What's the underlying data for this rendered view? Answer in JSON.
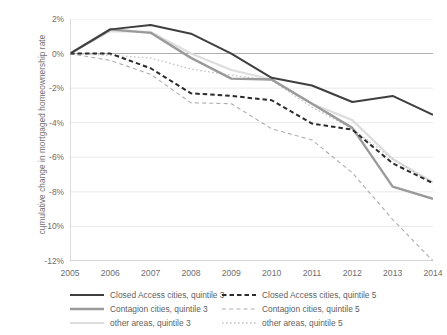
{
  "chart_data": {
    "type": "line",
    "title": "",
    "subtitle": "",
    "xlabel": "",
    "ylabel": "cumulative change in mortgaged homeownership rate",
    "x": [
      2005,
      2006,
      2007,
      2008,
      2009,
      2010,
      2011,
      2012,
      2013,
      2014
    ],
    "xticklabels": [
      "2005",
      "2006",
      "2007",
      "2008",
      "2009",
      "2010",
      "2011",
      "2012",
      "2013",
      "2014"
    ],
    "yticklabels": [
      "2%",
      "0%",
      "-2%",
      "-4%",
      "-6%",
      "-8%",
      "-10%",
      "-12%"
    ],
    "yticks": [
      2,
      0,
      -2,
      -4,
      -6,
      -8,
      -10,
      -12
    ],
    "ylim": [
      -12,
      2
    ],
    "xlim": [
      2005,
      2014
    ],
    "grid": "horizontal",
    "legend_position": "bottom",
    "units": "percent",
    "series": [
      {
        "name": "Closed Access cities, quintile 3",
        "style": "solid",
        "color": "#3f3f3f",
        "width": 2.0,
        "values": [
          0.0,
          1.4,
          1.65,
          1.15,
          0.0,
          -1.4,
          -1.85,
          -2.8,
          -2.45,
          -3.55
        ]
      },
      {
        "name": "Closed Access cities, quintile 5",
        "style": "dashed",
        "color": "#2b2b2b",
        "width": 2.0,
        "values": [
          0.0,
          0.0,
          -0.85,
          -2.3,
          -2.45,
          -2.7,
          -4.05,
          -4.4,
          -6.35,
          -7.5
        ]
      },
      {
        "name": "Contagion cities, quintile 3",
        "style": "solid",
        "color": "#9a9a9a",
        "width": 2.4,
        "values": [
          0.0,
          1.4,
          1.2,
          -0.25,
          -1.45,
          -1.5,
          -2.9,
          -4.3,
          -7.7,
          -8.4
        ]
      },
      {
        "name": "Contagion cities, quintile 5",
        "style": "dashed",
        "color": "#adadad",
        "width": 1.1,
        "values": [
          0.0,
          -0.4,
          -1.2,
          -2.85,
          -2.9,
          -4.35,
          -5.0,
          -6.9,
          -9.6,
          -12.0
        ]
      },
      {
        "name": "other areas, quintile 3",
        "style": "solid",
        "color": "#dddddd",
        "width": 2.2,
        "values": [
          0.0,
          1.3,
          1.25,
          0.0,
          -0.95,
          -1.5,
          -2.9,
          -3.85,
          -6.1,
          -7.45
        ]
      },
      {
        "name": "other areas, quintile 5",
        "style": "dotted",
        "color": "#c4c4c4",
        "width": 1.3,
        "values": [
          0.0,
          -0.1,
          -0.25,
          -0.9,
          -1.25,
          -1.55,
          -3.1,
          -4.35,
          -6.1,
          -7.5
        ]
      }
    ]
  },
  "axis": {
    "y_title": "cumulative change in mortgaged homeownership rate"
  },
  "legend": {
    "items": [
      {
        "label": "Closed Access cities, quintile 3",
        "style": "solid",
        "color": "#3f3f3f",
        "width": 2.0
      },
      {
        "label": "Closed Access cities, quintile 5",
        "style": "dashed",
        "color": "#2b2b2b",
        "width": 2.2
      },
      {
        "label": "Contagion cities, quintile 3",
        "style": "solid",
        "color": "#9a9a9a",
        "width": 2.4
      },
      {
        "label": "Contagion cities, quintile 5",
        "style": "dashed",
        "color": "#adadad",
        "width": 1.1
      },
      {
        "label": "other areas, quintile 3",
        "style": "solid",
        "color": "#dddddd",
        "width": 2.2
      },
      {
        "label": "other areas, quintile 5",
        "style": "dotted",
        "color": "#c4c4c4",
        "width": 1.3
      }
    ]
  },
  "colors": {
    "background": "#ffffff",
    "axis": "#b9b9b9",
    "grid": "#e6e6e6",
    "zero_line": "#b0b0b0",
    "text": "#6e6e6e"
  }
}
